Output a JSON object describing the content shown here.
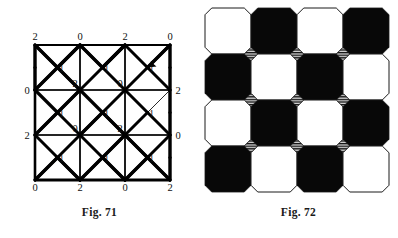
{
  "figures": [
    {
      "id": "fig71",
      "caption": "Fig. 71",
      "type": "labeled-grid-with-diagonals",
      "grid": {
        "columns": 3,
        "rows": 3,
        "origin_x": 35,
        "origin_y": 45,
        "cell_size": 45
      },
      "vertex_labels": [
        [
          "2",
          "0",
          "2",
          "0"
        ],
        [
          "0",
          "2",
          "0",
          "2"
        ],
        [
          "2",
          "",
          "",
          "0"
        ],
        [
          "0",
          "2",
          "0",
          "2"
        ]
      ],
      "interior_labels": [
        [
          "1",
          "1",
          "1"
        ],
        [
          "1",
          "1",
          "1"
        ],
        [
          "1",
          "1",
          "1"
        ]
      ],
      "extra_node_labels": [
        {
          "text": "2",
          "col": 1,
          "row": 1
        },
        {
          "text": "0",
          "col": 2,
          "row": 1
        },
        {
          "text": "0",
          "col": 1,
          "row": 2
        },
        {
          "text": "2",
          "col": 2,
          "row": 2
        }
      ],
      "stroke_colors": {
        "thin": "#2b2b2b",
        "thick": "#000000"
      },
      "thick_edges": [
        [
          0,
          0,
          1,
          1
        ],
        [
          1,
          1,
          0,
          2
        ],
        [
          0,
          2,
          1,
          3
        ],
        [
          1,
          3,
          0,
          4
        ],
        [
          1,
          1,
          2,
          0
        ],
        [
          2,
          0,
          3,
          1
        ],
        [
          3,
          1,
          4,
          0
        ],
        [
          0,
          0,
          0,
          1
        ],
        [
          0,
          1,
          0,
          2
        ],
        [
          6,
          0,
          6,
          1
        ],
        [
          6,
          1,
          6,
          2
        ],
        [
          6,
          2,
          6,
          3
        ],
        [
          6,
          3,
          6,
          4
        ],
        [
          6,
          4,
          6,
          5
        ],
        [
          6,
          5,
          6,
          6
        ],
        [
          0,
          6,
          1,
          5
        ],
        [
          1,
          5,
          2,
          6
        ],
        [
          2,
          6,
          3,
          5
        ],
        [
          3,
          5,
          4,
          6
        ],
        [
          4,
          6,
          5,
          5
        ],
        [
          5,
          5,
          6,
          6
        ],
        [
          1,
          1,
          2,
          2
        ],
        [
          2,
          2,
          3,
          3
        ],
        [
          3,
          3,
          4,
          4
        ],
        [
          4,
          4,
          5,
          5
        ],
        [
          2,
          2,
          1,
          3
        ],
        [
          3,
          3,
          2,
          4
        ],
        [
          4,
          4,
          3,
          5
        ],
        [
          2,
          0,
          1,
          1
        ],
        [
          4,
          0,
          3,
          1
        ],
        [
          6,
          0,
          5,
          1
        ]
      ]
    },
    {
      "id": "fig72",
      "caption": "Fig. 72",
      "type": "truncated-square-tiling",
      "grid": {
        "columns": 4,
        "rows": 4,
        "origin_x": 6,
        "origin_y": 8,
        "tile_pitch": 46,
        "octagon_radius": 23,
        "cut_ratio": 0.2929
      },
      "octagon_fill_pattern": [
        [
          "white",
          "black",
          "white",
          "black"
        ],
        [
          "black",
          "white",
          "black",
          "white"
        ],
        [
          "white",
          "black",
          "white",
          "black"
        ],
        [
          "black",
          "white",
          "black",
          "white"
        ]
      ],
      "interstitial_squares": {
        "fill": "hatched",
        "hatch_color": "#111111",
        "hatch_background": "#d8d8d8",
        "hatch_orientation": "horizontal",
        "rows": 3,
        "columns": 3
      },
      "colors": {
        "black": "#080808",
        "white": "#ffffff",
        "outline": "#1a1a1a"
      }
    }
  ]
}
